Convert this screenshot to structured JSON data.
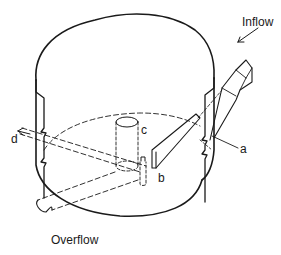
{
  "diagram": {
    "type": "isometric technical drawing of cylindrical tank",
    "labels": {
      "inflow": "Inflow",
      "overflow": "Overflow",
      "a": "a",
      "b": "b",
      "c": "c",
      "d": "d"
    },
    "colors": {
      "line": "#1a1a1a",
      "background": "#ffffff"
    }
  }
}
